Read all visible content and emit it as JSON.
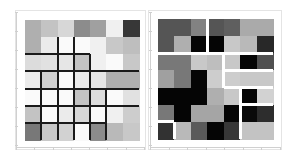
{
  "chart_data": [
    {
      "type": "heatmap",
      "title": "",
      "xlabel": "",
      "ylabel": "",
      "rows": 7,
      "cols": 7,
      "colormap": "grayscale (0=black, 255=white)",
      "values": [
        [
          175,
          195,
          215,
          140,
          160,
          240,
          55
        ],
        [
          175,
          235,
          250,
          250,
          240,
          200,
          190
        ],
        [
          220,
          225,
          230,
          195,
          240,
          250,
          200
        ],
        [
          235,
          210,
          250,
          235,
          230,
          175,
          175
        ],
        [
          250,
          250,
          250,
          195,
          220,
          250,
          225
        ],
        [
          195,
          250,
          235,
          215,
          250,
          240,
          205
        ],
        [
          120,
          200,
          210,
          250,
          140,
          185,
          200
        ]
      ],
      "overlay_lines": "black partition lines drawn along cell boundaries",
      "x_ticks": 8,
      "y_ticks": 8,
      "tick_labels_legible": false
    },
    {
      "type": "heatmap",
      "title": "",
      "xlabel": "",
      "ylabel": "",
      "rows": 7,
      "cols": 7,
      "colormap": "grayscale (0=black, 255=white)",
      "values": [
        [
          85,
          85,
          130,
          85,
          95,
          170,
          170
        ],
        [
          85,
          175,
          5,
          5,
          200,
          185,
          40
        ],
        [
          120,
          120,
          200,
          190,
          200,
          5,
          80
        ],
        [
          160,
          120,
          5,
          205,
          205,
          200,
          200
        ],
        [
          5,
          5,
          5,
          175,
          200,
          5,
          210
        ],
        [
          120,
          5,
          165,
          165,
          5,
          10,
          45
        ],
        [
          50,
          185,
          90,
          5,
          55,
          195,
          195
        ]
      ],
      "overlay": "white gaps separating tile blocks",
      "x_ticks": 8,
      "y_ticks": 8,
      "tick_labels_legible": false
    }
  ],
  "panels": [
    {
      "name": "left-heatmap"
    },
    {
      "name": "right-heatmap"
    }
  ]
}
